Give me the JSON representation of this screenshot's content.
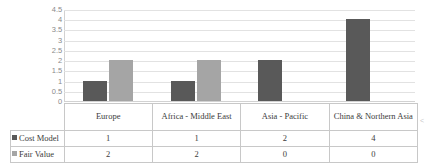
{
  "chart_data": {
    "type": "bar",
    "title": "",
    "subtitle": "",
    "xlabel": "",
    "ylabel": "",
    "ylim": [
      0,
      4.5
    ],
    "grid": true,
    "legend_position": "table-left",
    "categories": [
      "Europe",
      "Africa - Middle East",
      "Asia - Pacific",
      "China & Northern Asia"
    ],
    "series": [
      {
        "name": "Cost Model",
        "values": [
          1,
          1,
          2,
          4
        ],
        "color": "#595959"
      },
      {
        "name": "Fair Value",
        "values": [
          2,
          2,
          0,
          0
        ],
        "color": "#a5a5a5"
      }
    ],
    "y_ticks": [
      "0",
      "0.5",
      "1",
      "1.5",
      "2",
      "2.5",
      "3",
      "3.5",
      "4",
      "4.5"
    ],
    "y_tick_values": [
      0,
      0.5,
      1,
      1.5,
      2,
      2.5,
      3,
      3.5,
      4,
      4.5
    ]
  },
  "data_table": {
    "row_headers": [
      "Cost Model",
      "Fair Value"
    ],
    "column_headers": [
      "Europe",
      "Africa - Middle East",
      "Asia - Pacific",
      "China & Northern Asia"
    ],
    "rows": [
      {
        "label": "Cost Model",
        "marker": "series-marker-cost-model",
        "cells": [
          "1",
          "1",
          "2",
          "4"
        ]
      },
      {
        "label": "Fair Value",
        "marker": "series-marker-fair-value",
        "cells": [
          "2",
          "2",
          "0",
          "0"
        ]
      }
    ]
  },
  "artifact": {
    "right_edge_mark": "<"
  }
}
